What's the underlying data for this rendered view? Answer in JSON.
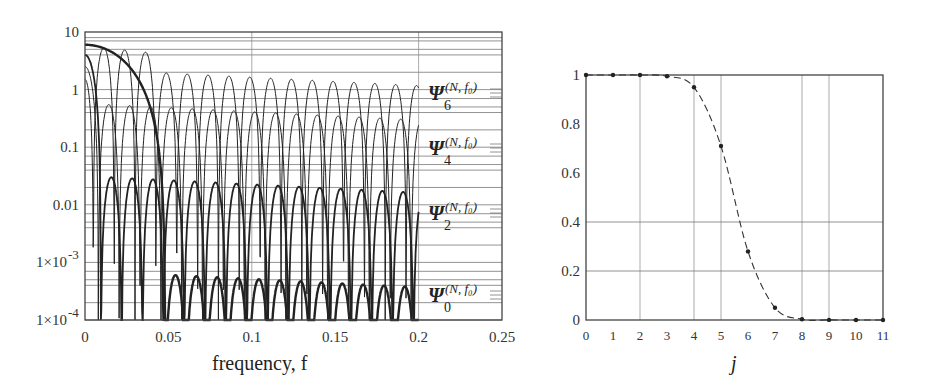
{
  "chart_data": [
    {
      "type": "line",
      "title": "",
      "xlabel": "frequency, f",
      "ylabel": "",
      "yscale": "log",
      "xlim": [
        0,
        0.25
      ],
      "ylim": [
        0.0001,
        10
      ],
      "x_ticks": [
        "0",
        "0.05",
        "0.1",
        "0.15",
        "0.2",
        "0.25"
      ],
      "y_ticks": [
        "10",
        "1",
        "0.1",
        "0.01",
        "1×10⁻³",
        "1×10⁻⁴"
      ],
      "grid": true,
      "series": [
        {
          "name": "Ψ6(N,f0)",
          "label_base": "Ψ",
          "label_sub": "6",
          "label_sup": "(N, f0)",
          "peak_start": 1.5,
          "sidelobe_level": 2.2,
          "first_null": 0.005,
          "lobe_width": 0.0125,
          "width": 1.0
        },
        {
          "name": "Ψ4(N,f0)",
          "label_base": "Ψ",
          "label_sub": "4",
          "label_sup": "(N, f0)",
          "peak_start": 2.5,
          "sidelobe_level": 0.55,
          "first_null": 0.008,
          "lobe_width": 0.0125,
          "width": 1.0
        },
        {
          "name": "Ψ2(N,f0)",
          "label_base": "Ψ",
          "label_sub": "2",
          "label_sup": "(N, f0)",
          "peak_start": 4.0,
          "sidelobe_level": 0.03,
          "first_null": 0.0095,
          "lobe_width": 0.0125,
          "width": 1.8
        },
        {
          "name": "Ψ0(N,f0)",
          "label_base": "Ψ",
          "label_sub": "0",
          "label_sup": "(N, f0)",
          "peak_start": 6.0,
          "sidelobe_level": 0.0006,
          "first_null": 0.048,
          "lobe_width": 0.0125,
          "width": 2.4
        }
      ],
      "legend_position": "right of plot, inline labels"
    },
    {
      "type": "line",
      "title": "",
      "xlabel": "j",
      "ylabel": "",
      "x": [
        0,
        1,
        2,
        3,
        4,
        5,
        6,
        7,
        8,
        9,
        10,
        11
      ],
      "x_ticks": [
        "0",
        "1",
        "2",
        "3",
        "4",
        "5",
        "6",
        "7",
        "8",
        "9",
        "10",
        "11"
      ],
      "y_ticks": [
        "0",
        "0.2",
        "0.4",
        "0.6",
        "0.8",
        "1"
      ],
      "xlim": [
        0,
        11
      ],
      "ylim": [
        0,
        1
      ],
      "grid": true,
      "line_style": "dashed with markers",
      "series": [
        {
          "name": "eigenvalue",
          "values": [
            1.0,
            1.0,
            1.0,
            0.995,
            0.95,
            0.71,
            0.28,
            0.05,
            0.003,
            0.0005,
            0.0002,
            0.0
          ]
        }
      ]
    }
  ],
  "left_chart": {
    "xlabel": "frequency, f",
    "x_ticks": [
      "0",
      "0.05",
      "0.1",
      "0.15",
      "0.2",
      "0.25"
    ],
    "y_ticks": [
      "10",
      "1",
      "0.1",
      "0.01",
      "1×10",
      "1×10"
    ],
    "y_exp": [
      "",
      "",
      "",
      "",
      "-3",
      "-4"
    ],
    "labels": [
      {
        "base": "Ψ",
        "sub": "6",
        "sup": "(N, f₀)"
      },
      {
        "base": "Ψ",
        "sub": "4",
        "sup": "(N, f₀)"
      },
      {
        "base": "Ψ",
        "sub": "2",
        "sup": "(N, f₀)"
      },
      {
        "base": "Ψ",
        "sub": "0",
        "sup": "(N, f₀)"
      }
    ]
  },
  "right_chart": {
    "xlabel": "j",
    "x_ticks": [
      "0",
      "1",
      "2",
      "3",
      "4",
      "5",
      "6",
      "7",
      "8",
      "9",
      "10",
      "11"
    ],
    "y_ticks": [
      "0",
      "0.2",
      "0.4",
      "0.6",
      "0.8",
      "1"
    ]
  }
}
